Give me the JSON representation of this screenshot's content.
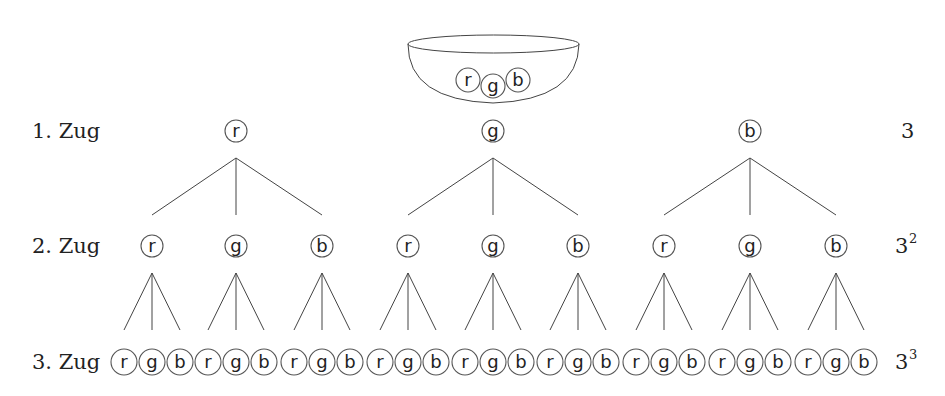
{
  "bowl": {
    "balls": [
      "r",
      "g",
      "b"
    ]
  },
  "levels": [
    {
      "label": "1. Zug",
      "count_base": "3",
      "count_exp": ""
    },
    {
      "label": "2. Zug",
      "count_base": "3",
      "count_exp": "2"
    },
    {
      "label": "3. Zug",
      "count_base": "3",
      "count_exp": "3"
    }
  ],
  "colors": [
    "r",
    "g",
    "b"
  ],
  "tree": {
    "level1": [
      "r",
      "g",
      "b"
    ],
    "level2": [
      "r",
      "g",
      "b",
      "r",
      "g",
      "b",
      "r",
      "g",
      "b"
    ],
    "level3": [
      "r",
      "g",
      "b",
      "r",
      "g",
      "b",
      "r",
      "g",
      "b",
      "r",
      "g",
      "b",
      "r",
      "g",
      "b",
      "r",
      "g",
      "b",
      "r",
      "g",
      "b",
      "r",
      "g",
      "b",
      "r",
      "g",
      "b"
    ]
  }
}
